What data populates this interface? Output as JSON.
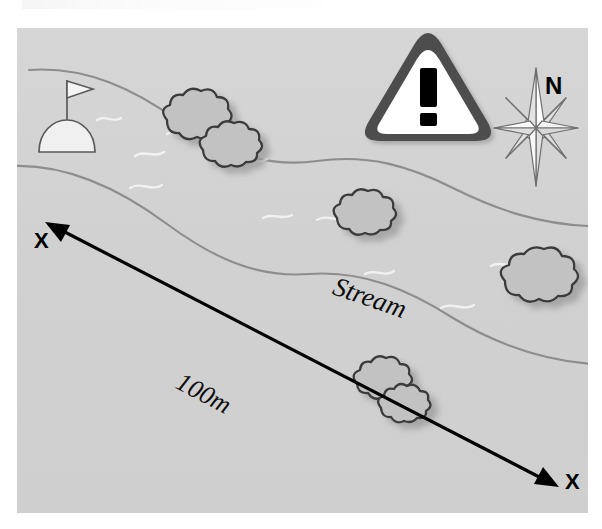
{
  "page": {
    "background_color": "#ffffff"
  },
  "map": {
    "panel_background": "#d2d2d2",
    "labels": {
      "stream": "Stream",
      "distance": "100m",
      "cross_section_start": "X",
      "cross_section_end": "X",
      "north": "N"
    },
    "icons": {
      "warning": "warning-triangle-icon",
      "warning_glyph": "!",
      "compass": "compass-rose-icon",
      "tent_flag": "tent-flag-marker-icon",
      "shrub": "shrub-icon",
      "stream_ripple": "water-ripple-icon",
      "transect_arrow": "double-headed-arrow-icon"
    },
    "colors": {
      "panel": "#d2d2d2",
      "stream_bank_line": "#8a8a8a",
      "shrub_fill": "#c0c0c0",
      "shrub_outline": "#3c3c3c",
      "shrub_shadow": "#b0b0b0",
      "warning_border": "#4d4d4d",
      "warning_fill": "#ffffff",
      "warning_mark": "#000000",
      "compass_fill": "#ffffff",
      "compass_outline": "#6e6e6e",
      "arrow_line": "#000000",
      "ripple": "#f2f2f2",
      "marker_fill": "#f0f0f0",
      "marker_outline": "#555555"
    },
    "features": {
      "stream_banks": 2,
      "shrub_clusters": 5,
      "ripples": 9,
      "transect_label": "X to X",
      "transect_length": "100m"
    }
  }
}
